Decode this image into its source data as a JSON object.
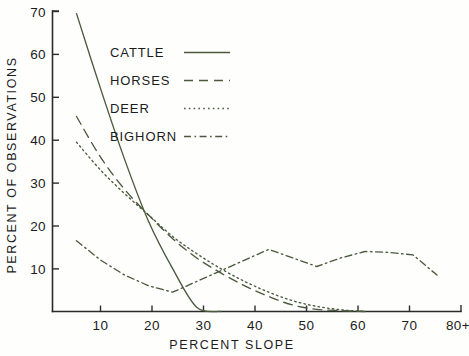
{
  "chart_data": {
    "type": "line",
    "title": "",
    "xlabel": "PERCENT  SLOPE",
    "ylabel": "PERCENT  OF  OBSERVATIONS",
    "xlim": [
      0,
      85
    ],
    "ylim": [
      0,
      70
    ],
    "grid": false,
    "legend_position": "upper-center-left",
    "xticks": [
      10,
      20,
      30,
      40,
      50,
      60,
      70,
      80
    ],
    "xtick_labels": [
      "10",
      "20",
      "30",
      "40",
      "50",
      "60",
      "70",
      "80+"
    ],
    "yticks": [
      10,
      20,
      30,
      40,
      50,
      60,
      70
    ],
    "ytick_labels": [
      "10",
      "20",
      "30",
      "40",
      "50",
      "60",
      "70"
    ],
    "x": [
      5,
      10,
      15,
      20,
      25,
      30,
      35,
      40,
      45,
      50,
      55,
      60,
      65,
      70,
      75,
      80
    ],
    "series": [
      {
        "name": "CATTLE",
        "style": "solid",
        "color": "#4a5a3c",
        "values": [
          69.5,
          52.0,
          35.5,
          21.0,
          10.0,
          1.0,
          0.0,
          0.0,
          0.0,
          0.0,
          0.0,
          0.0,
          0.0,
          0.0,
          0.0,
          0.0
        ]
      },
      {
        "name": "HORSES",
        "style": "dashed",
        "color": "#4a5a3c",
        "values": [
          45.5,
          36.0,
          28.5,
          22.5,
          17.0,
          12.5,
          9.0,
          6.0,
          3.5,
          1.5,
          0.5,
          0.2,
          0.0,
          0.0,
          0.0,
          0.0
        ]
      },
      {
        "name": "DEER",
        "style": "dotted",
        "color": "#4a5a3c",
        "values": [
          39.5,
          33.0,
          27.5,
          22.5,
          17.5,
          13.5,
          10.0,
          7.0,
          4.5,
          2.5,
          1.2,
          0.4,
          0.0,
          0.0,
          0.0,
          0.0
        ]
      },
      {
        "name": "BIGHORN",
        "style": "dashdot",
        "color": "#4a5a3c",
        "values": [
          16.5,
          12.0,
          8.5,
          6.0,
          4.5,
          7.0,
          9.5,
          12.0,
          14.5,
          12.5,
          10.5,
          12.5,
          14.0,
          13.8,
          13.2,
          8.5
        ]
      }
    ],
    "legend": [
      {
        "label": "CATTLE",
        "style": "solid"
      },
      {
        "label": "HORSES",
        "style": "dashed"
      },
      {
        "label": "DEER",
        "style": "dotted"
      },
      {
        "label": "BIGHORN",
        "style": "dashdot"
      }
    ]
  },
  "figure": {
    "background": "#fefefd",
    "ink_color": "#2b2b2b",
    "series_color": "#4a5a3c"
  }
}
